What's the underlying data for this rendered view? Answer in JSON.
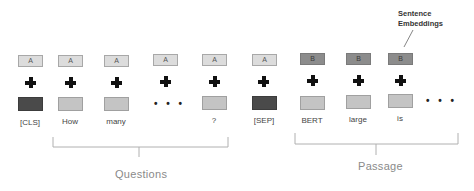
{
  "diagram": {
    "callout": {
      "line1": "Sentence",
      "line2": "Embeddings"
    },
    "columns": [
      {
        "segment": "A",
        "segment_type": "a",
        "token": "[CLS]",
        "token_type": "special",
        "x": 18
      },
      {
        "segment": "A",
        "segment_type": "a",
        "token": "How",
        "token_type": "word",
        "x": 58
      },
      {
        "segment": "A",
        "segment_type": "a",
        "token": "many",
        "token_type": "word",
        "x": 104
      },
      {
        "segment": "A",
        "segment_type": "a",
        "token": "...",
        "token_type": "ellipsis",
        "x": 153
      },
      {
        "segment": "A",
        "segment_type": "a",
        "token": "?",
        "token_type": "word",
        "x": 202
      },
      {
        "segment": "A",
        "segment_type": "a",
        "token": "[SEP]",
        "token_type": "special",
        "x": 252
      },
      {
        "segment": "B",
        "segment_type": "b",
        "token": "BERT",
        "token_type": "word",
        "x": 300
      },
      {
        "segment": "B",
        "segment_type": "b",
        "token": "large",
        "token_type": "word",
        "x": 346
      },
      {
        "segment": "B",
        "segment_type": "b",
        "token": "is",
        "token_type": "word",
        "x": 388
      },
      {
        "segment": "",
        "segment_type": "none",
        "token": "...",
        "token_type": "ellipsis",
        "x": 430
      }
    ],
    "groups": [
      {
        "label": "Questions",
        "from_x": 53,
        "to_x": 228
      },
      {
        "label": "Passage",
        "from_x": 295,
        "to_x": 458
      }
    ],
    "ellipsis": "• • •"
  }
}
